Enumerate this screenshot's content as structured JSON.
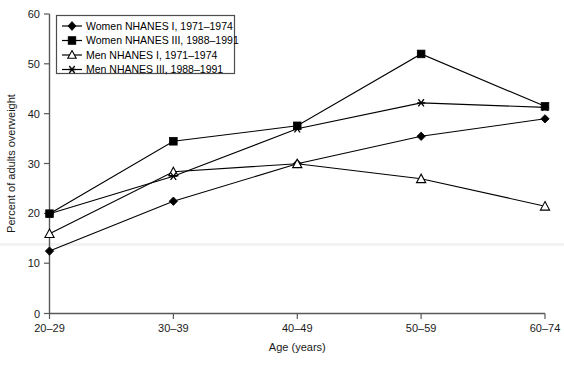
{
  "chart_data": {
    "type": "line",
    "title": "",
    "subtitle": "",
    "xlabel": "Age (years)",
    "ylabel": "Percent of adults overweight",
    "categories": [
      "20–29",
      "30–39",
      "40–49",
      "50–59",
      "60–74"
    ],
    "x_tick_labels": [
      "20–29",
      "30–39",
      "40–49",
      "50–59",
      "60–74"
    ],
    "y_tick_labels": [
      "0",
      "10",
      "20",
      "30",
      "40",
      "50",
      "60"
    ],
    "y_ticks": [
      0,
      10,
      20,
      30,
      40,
      50,
      60
    ],
    "ylim": [
      0,
      60
    ],
    "grid": false,
    "legend_position": "top-left",
    "series": [
      {
        "name": "Women NHANES I, 1971–1974",
        "marker": "filled-diamond",
        "values": [
          12.5,
          22.5,
          30.0,
          35.5,
          39.0
        ]
      },
      {
        "name": "Women NHANES III, 1988–1991",
        "marker": "filled-square",
        "values": [
          20.0,
          34.5,
          37.6,
          52.0,
          41.5
        ]
      },
      {
        "name": "Men NHANES I, 1971–1974",
        "marker": "open-triangle",
        "values": [
          16.0,
          28.4,
          30.0,
          27.0,
          21.5
        ]
      },
      {
        "name": "Men NHANES III, 1988–1991",
        "marker": "star",
        "values": [
          20.0,
          27.5,
          37.0,
          42.2,
          41.3
        ]
      }
    ]
  },
  "legend": {
    "entries": [
      "Women NHANES I, 1971–1974",
      "Women NHANES III, 1988–1991",
      "Men NHANES I, 1971–1974",
      "Men NHANES III, 1988–1991"
    ]
  },
  "colors": {
    "series": "#000000",
    "axis": "#595959",
    "background": "#ffffff"
  }
}
